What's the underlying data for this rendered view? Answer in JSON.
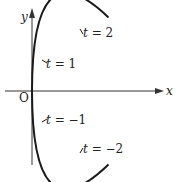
{
  "diagram": {
    "type": "parametric-curve",
    "axes": {
      "x_label": "x",
      "y_label": "y",
      "origin_label": "O"
    },
    "parameter_points": [
      {
        "label": "t = 2",
        "t": 2
      },
      {
        "label": "t = 1",
        "t": 1
      },
      {
        "label": "t = −1",
        "t": -1
      },
      {
        "label": "t = −2",
        "t": -2
      }
    ],
    "colors": {
      "curve": "#1a1a1a",
      "axes": "#333333",
      "background": "#ffffff"
    }
  }
}
